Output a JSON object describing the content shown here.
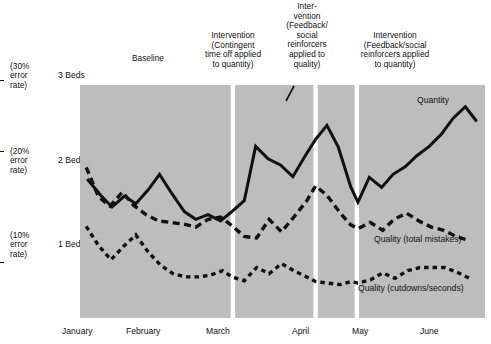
{
  "axes": {
    "y_ticks": [
      {
        "error_rate": "(30%\nerror\nrate)",
        "error_line1": "(30%",
        "error_line2": "error",
        "error_line3": "rate)",
        "beds": "3 Beds",
        "value": 3
      },
      {
        "error_rate": "(20%\nerror\nrate)",
        "error_line1": "(20%",
        "error_line2": "error",
        "error_line3": "rate)",
        "beds": "2 Beds",
        "value": 2
      },
      {
        "error_rate": "(10%\nerror\nrate)",
        "error_line1": "(10%",
        "error_line2": "error",
        "error_line3": "rate)",
        "beds": "1 Bed",
        "value": 1
      }
    ],
    "x_ticks": [
      "January",
      "February",
      "March",
      "April",
      "May",
      "June"
    ]
  },
  "phases": [
    {
      "id": "baseline",
      "label": "Baseline",
      "lines": [
        "Baseline"
      ]
    },
    {
      "id": "intervention-1",
      "label": "Intervention (Contingent time off applied to quantity)",
      "lines": [
        "Intervention",
        "(Contingent",
        "time off applied",
        "to quantity)"
      ]
    },
    {
      "id": "intervention-2",
      "label": "Intervention (Feedback/social reinforcers applied to quality)",
      "lines": [
        "Inter-",
        "vention",
        "(Feedback/",
        "social",
        "reinforcers",
        "applied to",
        "quality)"
      ]
    },
    {
      "id": "intervention-3",
      "label": "Intervention (Feedback/social reinforcers applied to quantity)",
      "lines": [
        "Intervention",
        "(Feedback/social",
        "reinforcers applied",
        "to quantity)"
      ]
    }
  ],
  "series_labels": {
    "quantity": "Quantity",
    "quality_mistakes": "Quality (total mistakes)",
    "quality_cutdowns": "Quality (cutdowns/seconds)"
  },
  "colors": {
    "plot_background": "#bdbdbd",
    "panel_divider": "#ffffff",
    "line": "#111111",
    "text": "#111111",
    "page_background": "#ffffff"
  },
  "chart_data": {
    "type": "line",
    "title": "",
    "subtitle": "",
    "xlabel": "",
    "ylabel": "Beds / error rate",
    "ylim": [
      0.25,
      3.25
    ],
    "grid": false,
    "legend": "inline-annotations",
    "y_tick_values": [
      1,
      2,
      3
    ],
    "y_tick_labels": [
      "1 Bed",
      "2 Beds",
      "3 Beds"
    ],
    "y_secondary_tick_labels": [
      "(10% error rate)",
      "(20% error rate)",
      "(30% error rate)"
    ],
    "x_tick_labels": [
      "January",
      "February",
      "March",
      "April",
      "May",
      "June"
    ],
    "x_tick_positions": [
      0.6,
      4.1,
      8.3,
      12.1,
      15.0,
      18.4
    ],
    "phase_boundaries": [
      7.4,
      11.4,
      13.4
    ],
    "phase_names": [
      "Baseline",
      "Intervention (Contingent time off applied to quantity)",
      "Intervention (Feedback/social reinforcers applied to quality)",
      "Intervention (Feedback/social reinforcers applied to quantity)"
    ],
    "series": [
      {
        "name": "Quantity",
        "style": "solid",
        "x": [
          0.35,
          1.0,
          1.55,
          2.15,
          2.7,
          3.3,
          3.85,
          4.45,
          5.05,
          5.6,
          6.2,
          6.8,
          7.35,
          7.95,
          8.5,
          9.1,
          9.7,
          10.3,
          10.9,
          11.4,
          11.95,
          12.5,
          13.1,
          13.45,
          14.0,
          14.6,
          15.15,
          15.75,
          16.3,
          16.9,
          17.5,
          18.05,
          18.65,
          19.2
        ],
        "y": [
          2.04,
          1.83,
          1.68,
          1.82,
          1.72,
          1.9,
          2.1,
          1.85,
          1.62,
          1.52,
          1.58,
          1.5,
          1.62,
          1.76,
          2.46,
          2.3,
          2.22,
          2.07,
          2.34,
          2.55,
          2.73,
          2.45,
          1.94,
          1.74,
          2.06,
          1.93,
          2.1,
          2.2,
          2.34,
          2.46,
          2.62,
          2.82,
          2.97,
          2.78
        ]
      },
      {
        "name": "Quality (total mistakes)",
        "style": "dashed",
        "x": [
          0.3,
          0.9,
          1.45,
          2.05,
          2.6,
          3.2,
          3.8,
          4.4,
          5.0,
          5.6,
          6.2,
          6.8,
          7.35,
          7.95,
          8.55,
          9.15,
          9.75,
          10.35,
          10.95,
          11.4,
          11.95,
          12.6,
          13.1,
          13.45,
          14.05,
          14.65,
          15.2,
          15.8,
          16.4,
          17.0,
          17.6,
          18.2,
          18.8
        ],
        "y": [
          2.19,
          1.81,
          1.69,
          1.87,
          1.7,
          1.58,
          1.5,
          1.48,
          1.46,
          1.42,
          1.52,
          1.55,
          1.44,
          1.3,
          1.28,
          1.52,
          1.36,
          1.55,
          1.75,
          1.95,
          1.83,
          1.6,
          1.45,
          1.4,
          1.48,
          1.38,
          1.52,
          1.6,
          1.5,
          1.42,
          1.38,
          1.3,
          1.25
        ]
      },
      {
        "name": "Quality (cutdowns/seconds)",
        "style": "dotted",
        "x": [
          0.3,
          0.9,
          1.5,
          2.1,
          2.7,
          3.3,
          3.9,
          4.5,
          5.1,
          5.7,
          6.3,
          6.9,
          7.35,
          7.95,
          8.55,
          9.15,
          9.75,
          10.35,
          10.95,
          11.4,
          11.95,
          12.6,
          13.1,
          13.45,
          14.05,
          14.65,
          15.25,
          15.85,
          16.45,
          17.05,
          17.65,
          18.25,
          18.85
        ],
        "y": [
          1.43,
          1.18,
          1.0,
          1.17,
          1.32,
          1.1,
          0.93,
          0.82,
          0.78,
          0.78,
          0.8,
          0.86,
          0.78,
          0.73,
          0.9,
          0.82,
          0.95,
          0.86,
          0.78,
          0.72,
          0.7,
          0.68,
          0.72,
          0.7,
          0.74,
          0.83,
          0.76,
          0.86,
          0.9,
          0.9,
          0.9,
          0.84,
          0.76
        ]
      }
    ]
  }
}
